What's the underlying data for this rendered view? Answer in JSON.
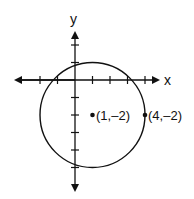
{
  "diagram": {
    "type": "coordinate-plane-circle",
    "axes": {
      "x_label": "x",
      "y_label": "y",
      "tick_spacing_units": 1
    },
    "circle": {
      "center": [
        1,
        -2
      ],
      "radius": 3
    },
    "points": [
      {
        "label": "(1,–2)",
        "x": 1,
        "y": -2
      },
      {
        "label": "(4,–2)",
        "x": 4,
        "y": -2
      }
    ],
    "colors": {
      "stroke": "#111111",
      "background": "#ffffff"
    }
  }
}
